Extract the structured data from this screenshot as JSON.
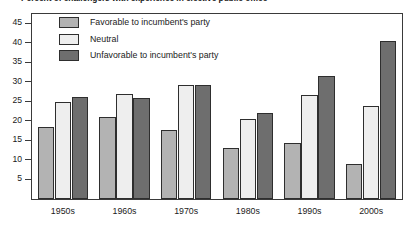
{
  "chart_data": {
    "type": "bar",
    "title": "Percent of challengers with experience in elective public office",
    "xlabel": "",
    "ylabel": "",
    "categories": [
      "1950s",
      "1960s",
      "1970s",
      "1980s",
      "1990s",
      "2000s"
    ],
    "series": [
      {
        "name": "Favorable to incumbent's party",
        "color": "#b3b3b3",
        "values": [
          18.5,
          21.0,
          17.8,
          13.0,
          14.3,
          9.0
        ]
      },
      {
        "name": "Neutral",
        "color": "#eeeeee",
        "values": [
          25.0,
          27.0,
          29.3,
          20.5,
          26.8,
          23.8
        ]
      },
      {
        "name": "Unfavorable to incumbent's party",
        "color": "#6e6e6e",
        "values": [
          26.3,
          26.0,
          29.3,
          22.0,
          31.5,
          40.5
        ]
      }
    ],
    "ylim": [
      0,
      47.5
    ],
    "yticks": [
      5,
      10,
      15,
      20,
      25,
      30,
      35,
      40,
      45
    ],
    "ytick_labels": [
      "5",
      "10",
      "15",
      "20",
      "25",
      "30",
      "35",
      "40",
      "45"
    ],
    "grid": false,
    "legend_position": "inside-top-left",
    "frame": true,
    "axis_color": "#3a3a3a",
    "bar_edge_color": "#2e2e2e",
    "text_color": "#1a1a1a"
  }
}
